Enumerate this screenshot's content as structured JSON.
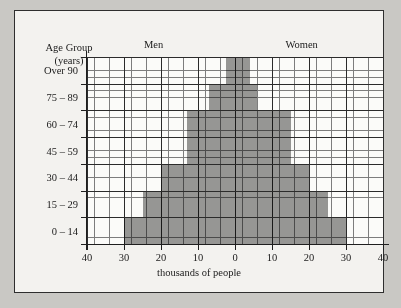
{
  "chart_data": {
    "type": "bar",
    "title": "",
    "subtitle": "",
    "xlabel": "thousands of people",
    "ylabel": "Age Group (years)",
    "ylabel_line1": "Age Group",
    "ylabel_line2": "(years)",
    "orientation": "horizontal",
    "style": "population-pyramid",
    "grid": true,
    "legend_position": "top",
    "xlim": [
      -40,
      40
    ],
    "xtick_positions": [
      -40,
      -30,
      -20,
      -10,
      0,
      10,
      20,
      30,
      40
    ],
    "xtick_labels": [
      "40",
      "30",
      "20",
      "10",
      "0",
      "10",
      "20",
      "30",
      "40"
    ],
    "minor_tick_step": 2,
    "major_tick_step": 10,
    "categories": [
      "0 – 14",
      "15 – 29",
      "30 – 44",
      "45 – 59",
      "60 – 74",
      "75 – 89",
      "Over 90"
    ],
    "series": [
      {
        "name": "Men",
        "side": "left",
        "values": [
          30,
          25,
          20,
          13,
          13,
          7,
          2.5
        ]
      },
      {
        "name": "Women",
        "side": "right",
        "values": [
          30,
          25,
          20,
          15,
          15,
          6,
          4
        ]
      }
    ],
    "bar_color": "#8a8a8a",
    "axis_color": "#1e1e1e",
    "grid_color": "#7d7d7d",
    "plot_background": "#fbfbf9",
    "page_background": "#c9c8c4",
    "frame_background": "#f3f2ef"
  },
  "headers": {
    "men": "Men",
    "women": "Women"
  }
}
